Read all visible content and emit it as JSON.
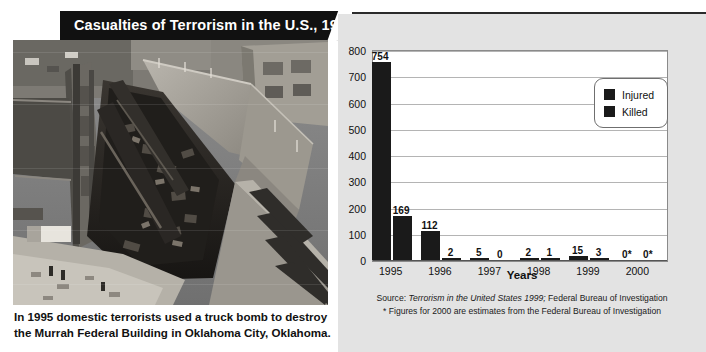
{
  "banner": {
    "title": "Casualties of Terrorism in the U.S., 1995–2000"
  },
  "photo": {
    "alt_name": "aerial-photo-murrah-building-bombing"
  },
  "caption": {
    "line1": "In 1995 domestic terrorists used a truck bomb to destroy",
    "line2": "the Murrah Federal Building in Oklahoma City, Oklahoma."
  },
  "legend": {
    "items": [
      {
        "label": "Injured",
        "color": "#1a1a1a"
      },
      {
        "label": "Killed",
        "color": "#1a1a1a"
      }
    ]
  },
  "source": {
    "line1_prefix": "Source: ",
    "line1_italic": "Terrorism in the United States 1999;",
    "line1_suffix": " Federal Bureau of Investigation",
    "line2": "* Figures for 2000 are estimates from the Federal Bureau of Investigation"
  },
  "chart_data": {
    "type": "bar",
    "title": "Casualties of Terrorism in the U.S., 1995–2000",
    "xlabel": "Years",
    "ylabel": "",
    "categories": [
      "1995",
      "1996",
      "1997",
      "1998",
      "1999",
      "2000"
    ],
    "series": [
      {
        "name": "Injured",
        "values": [
          754,
          112,
          5,
          2,
          15,
          0
        ],
        "labels": [
          "754",
          "112",
          "5",
          "2",
          "15",
          "0*"
        ]
      },
      {
        "name": "Killed",
        "values": [
          169,
          2,
          0,
          1,
          3,
          0
        ],
        "labels": [
          "169",
          "2",
          "0",
          "1",
          "3",
          "0*"
        ]
      }
    ],
    "ylim": [
      0,
      800
    ],
    "yticks": [
      0,
      100,
      200,
      300,
      400,
      500,
      600,
      700,
      800
    ],
    "ytick_labels": [
      "0",
      "100",
      "200",
      "300",
      "400",
      "500",
      "600",
      "700",
      "800"
    ],
    "grid": true,
    "legend_position": "top-right",
    "bar_color": "#1a1a1a",
    "plot_background": "#ffffff",
    "panel_background": "#e3e3e3"
  }
}
